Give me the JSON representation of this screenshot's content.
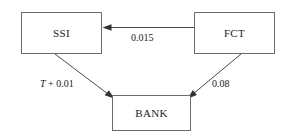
{
  "diagram": {
    "type": "node-link-diagram",
    "canvas": {
      "width": 287,
      "height": 138,
      "background": "#ffffff"
    },
    "nodes": [
      {
        "id": "ssi",
        "label": "SSI",
        "x": 21,
        "y": 12,
        "width": 81,
        "height": 42
      },
      {
        "id": "fct",
        "label": "FCT",
        "x": 194,
        "y": 12,
        "width": 81,
        "height": 42
      },
      {
        "id": "bank",
        "label": "BANK",
        "x": 112,
        "y": 95,
        "width": 79,
        "height": 36
      }
    ],
    "edges": [
      {
        "id": "fct-to-ssi",
        "from": "fct",
        "to": "ssi",
        "label": "0.015",
        "label_prefix": "",
        "label_italic": "",
        "direction": "right-to-left",
        "style": "straight-horizontal"
      },
      {
        "id": "ssi-to-bank",
        "from": "ssi",
        "to": "bank",
        "label": " + 0.01",
        "label_italic": "T",
        "label_full": "T + 0.01",
        "direction": "down-right",
        "style": "diagonal"
      },
      {
        "id": "fct-to-bank",
        "from": "fct",
        "to": "bank",
        "label": "0.08",
        "label_italic": "",
        "direction": "down-left",
        "style": "diagonal"
      }
    ],
    "colors": {
      "box_border": "#6b6b6b",
      "line": "#4a4a4a",
      "arrow_head": "#333333",
      "text": "#1a1a1a",
      "background": "#ffffff"
    }
  }
}
